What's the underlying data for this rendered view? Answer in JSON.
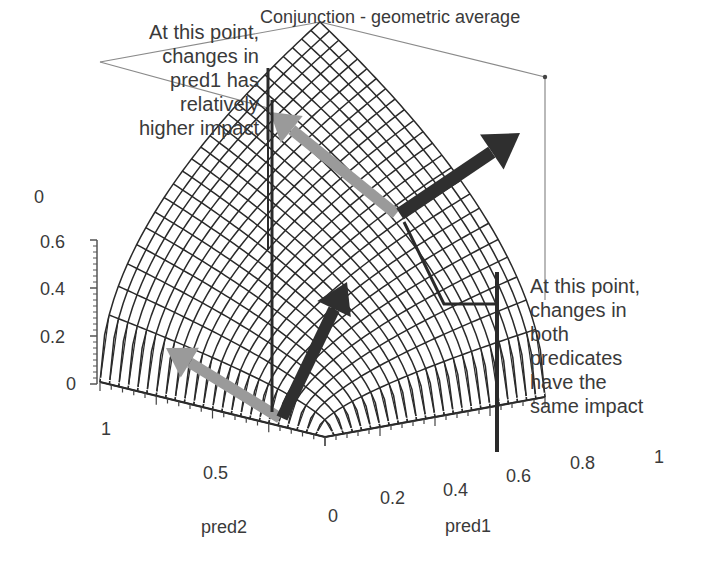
{
  "chart_data": {
    "type": "surface3d",
    "title": "Conjunction - geometric average",
    "function": "z = sqrt(pred1 * pred2)",
    "xlabel": "pred1",
    "ylabel": "pred2",
    "zlabel": "",
    "x_ticks": [
      "0",
      "0.2",
      "0.4",
      "0.6",
      "0.8",
      "1"
    ],
    "y_ticks": [
      "1",
      "0.5",
      "0"
    ],
    "z_ticks": [
      "0",
      "0.2",
      "0.4",
      "0.6"
    ],
    "z_top_tick": "0",
    "xlim": [
      0,
      1
    ],
    "ylim": [
      0,
      1
    ],
    "zlim": [
      0,
      1
    ],
    "grid_resolution": 24,
    "annotations": [
      {
        "id": "left",
        "text_lines": [
          "At this point,",
          "changes in",
          "pred1 has",
          "relatively",
          "higher impact"
        ],
        "arrows": [
          {
            "name": "pred1-gradient",
            "color": "#2f2f2f"
          },
          {
            "name": "pred2-gradient",
            "color": "#9a9a9a"
          }
        ]
      },
      {
        "id": "right",
        "text_lines": [
          "At this point,",
          "changes in",
          "both",
          "predicates",
          "have the",
          "same impact"
        ],
        "arrows": [
          {
            "name": "pred1-gradient",
            "color": "#2f2f2f"
          },
          {
            "name": "pred2-gradient",
            "color": "#9a9a9a"
          }
        ]
      }
    ],
    "colors": {
      "mesh": "#2a2a2a",
      "box": "#8a8a8a",
      "dark_arrow": "#2f2f2f",
      "light_arrow": "#9a9a9a"
    }
  }
}
